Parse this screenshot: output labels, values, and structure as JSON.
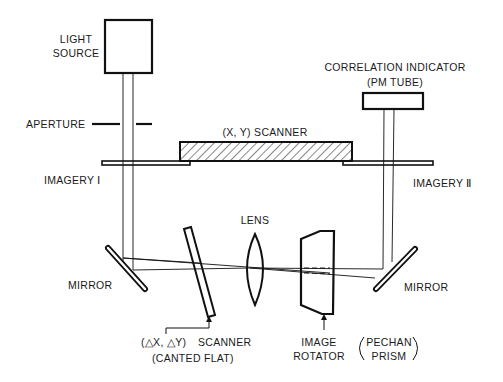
{
  "diagram": {
    "components": {
      "light_source": {
        "line1": "LIGHT",
        "line2": "SOURCE"
      },
      "aperture": {
        "label": "APERTURE"
      },
      "xy_scanner": {
        "label": "(X, Y) SCANNER"
      },
      "imagery_1": {
        "label": "IMAGERY Ⅰ"
      },
      "imagery_2": {
        "label": "IMAGERY Ⅱ"
      },
      "correlation_indicator": {
        "line1": "CORRELATION INDICATOR",
        "line2": "(PM TUBE)"
      },
      "lens": {
        "label": "LENS"
      },
      "mirror_left": {
        "label": "MIRROR"
      },
      "mirror_right": {
        "label": "MIRROR"
      },
      "dxdy_scanner": {
        "line1a": "(△X, △Y)",
        "line1b": "SCANNER",
        "line2": "(CANTED FLAT)"
      },
      "image_rotator": {
        "line1": "IMAGE",
        "line2": "ROTATOR"
      },
      "pechan_prism": {
        "line1": "PECHAN",
        "line2": "PRISM"
      }
    }
  }
}
